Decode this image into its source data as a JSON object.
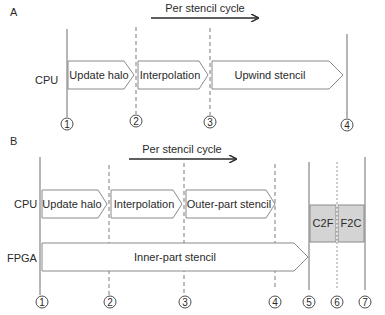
{
  "panel_a": {
    "label": "A",
    "cycle_label": "Per stencil cycle",
    "row_label": "CPU",
    "tasks": [
      {
        "label": "Update halo"
      },
      {
        "label": "Interpolation"
      },
      {
        "label": "Upwind stencil"
      }
    ],
    "markers": [
      "1",
      "2",
      "3",
      "4"
    ]
  },
  "panel_b": {
    "label": "B",
    "cycle_label": "Per stencil cycle",
    "cpu_row_label": "CPU",
    "fpga_row_label": "FPGA",
    "cpu_tasks": [
      {
        "label": "Update halo"
      },
      {
        "label": "Interpolation"
      },
      {
        "label": "Outer-part stencil"
      }
    ],
    "fpga_task": {
      "label": "Inner-part stencil"
    },
    "transfers": [
      {
        "label": "C2F",
        "color": "#d4d4d4"
      },
      {
        "label": "F2C",
        "color": "#d4d4d4"
      }
    ],
    "markers": [
      "1",
      "2",
      "3",
      "4",
      "5",
      "6",
      "7"
    ]
  }
}
